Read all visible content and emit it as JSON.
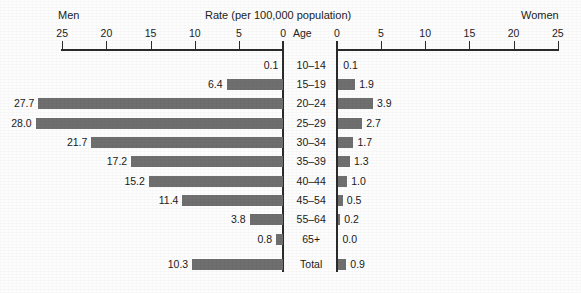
{
  "header": {
    "left_group_label": "Men",
    "right_group_label": "Women",
    "title": "Rate (per 100,000 population)",
    "center_column_label": "Age"
  },
  "axes": {
    "left_ticks": [
      "25",
      "20",
      "15",
      "10",
      "5",
      "0"
    ],
    "right_ticks": [
      "0",
      "5",
      "10",
      "15",
      "20",
      "25"
    ],
    "max": 25,
    "min": 0
  },
  "chart_data": {
    "type": "bar",
    "title": "Rate (per 100,000 population)",
    "subtitle": "",
    "xlabel": "Rate (per 100,000 population)",
    "ylabel": "Age",
    "orientation": "horizontal",
    "style": "population-pyramid",
    "xlim": [
      0,
      25
    ],
    "grid": false,
    "legend_position": "top",
    "categories": [
      "10–14",
      "15–19",
      "20–24",
      "25–29",
      "30–34",
      "35–39",
      "40–44",
      "45–54",
      "55–64",
      "65+",
      "Total"
    ],
    "series": [
      {
        "name": "Men",
        "side": "left",
        "values": [
          0.1,
          6.4,
          27.7,
          28.0,
          21.7,
          17.2,
          15.2,
          11.4,
          3.8,
          0.8,
          10.3
        ],
        "labels": [
          "0.1",
          "6.4",
          "27.7",
          "28.0",
          "21.7",
          "17.2",
          "15.2",
          "11.4",
          "3.8",
          "0.8",
          "10.3"
        ]
      },
      {
        "name": "Women",
        "side": "right",
        "values": [
          0.1,
          1.9,
          3.9,
          2.7,
          1.7,
          1.3,
          1.0,
          0.5,
          0.2,
          0.0,
          0.9
        ],
        "labels": [
          "0.1",
          "1.9",
          "3.9",
          "2.7",
          "1.7",
          "1.3",
          "1.0",
          "0.5",
          "0.2",
          "0.0",
          "0.9"
        ]
      }
    ]
  },
  "colors": {
    "bar_fill": "#6f6f6f",
    "axis": "#2b2b2b",
    "text": "#1a1a1a",
    "background": "#fdfdfd"
  }
}
